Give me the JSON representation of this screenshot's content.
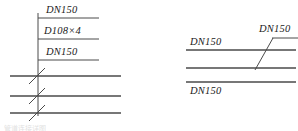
{
  "drawing": {
    "title": "Pipe connection detail",
    "line_color": "#4a4a4a",
    "text_color": "#1a1a1a",
    "background": "#ffffff",
    "caption_fragment": "管道连接详图"
  },
  "left_detail": {
    "name": "left-pipe-detail",
    "labels": {
      "top": "DN150",
      "middle": "D108×4",
      "bottom": "DN150"
    },
    "leader": {
      "x": 38,
      "y_top": 13,
      "y_bottom": 116
    },
    "underlines": [
      {
        "y": 18,
        "x1": 38,
        "x2": 99
      },
      {
        "y": 39,
        "x1": 38,
        "x2": 99
      },
      {
        "y": 60,
        "x1": 38,
        "x2": 99
      }
    ],
    "pipe_lines": [
      {
        "y": 76,
        "x1": 10,
        "x2": 121
      },
      {
        "y": 96,
        "x1": 10,
        "x2": 121
      },
      {
        "y": 113,
        "x1": 10,
        "x2": 121
      }
    ],
    "break_marks": [
      {
        "y": 76
      },
      {
        "y": 96
      },
      {
        "y": 113
      }
    ]
  },
  "right_detail": {
    "name": "right-pipe-detail",
    "labels": {
      "upper_left": "DN150",
      "upper_right": "DN150",
      "lower": "DN150"
    },
    "pipe_lines": [
      {
        "y": 50,
        "x1": 186,
        "x2": 296
      },
      {
        "y": 68,
        "x1": 186,
        "x2": 296
      },
      {
        "y": 82,
        "x1": 186,
        "x2": 296
      }
    ],
    "leader_upper": {
      "y": 38,
      "x1": 272,
      "x2": 298
    },
    "transition_diagonal": {
      "x1": 255,
      "y1": 70,
      "x2": 273,
      "y2": 38
    }
  }
}
